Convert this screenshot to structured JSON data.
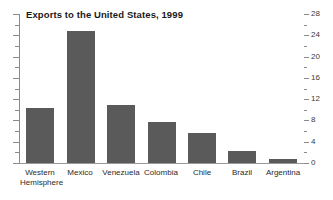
{
  "chart_data": {
    "type": "bar",
    "title": "Exports to the United States, 1999",
    "xlabel": "",
    "ylabel": "",
    "categories": [
      "Western Hemisphere",
      "Mexico",
      "Venezuela",
      "Colombia",
      "Chile",
      "Brazil",
      "Argentina"
    ],
    "category_lines": [
      [
        "Western",
        "Hemisphere"
      ],
      [
        "Mexico",
        ""
      ],
      [
        "Venezuela",
        ""
      ],
      [
        "Colombia",
        ""
      ],
      [
        "Chile",
        ""
      ],
      [
        "Brazil",
        ""
      ],
      [
        "Argentina",
        ""
      ]
    ],
    "values": [
      10.3,
      24.8,
      10.9,
      7.7,
      5.6,
      2.3,
      0.8
    ],
    "ylim": [
      0,
      28
    ],
    "yticks": [
      0,
      4,
      8,
      12,
      16,
      20,
      24,
      28
    ],
    "ytick_labels": [
      "0",
      "4",
      "8",
      "12",
      "16",
      "20",
      "24",
      "28"
    ],
    "yminor_step": 2,
    "axis_position": "right",
    "grid": false,
    "legend": false,
    "bar_color": "#5a5a5a",
    "axis_color": "#8a8a8a",
    "background": "#ffffff"
  }
}
